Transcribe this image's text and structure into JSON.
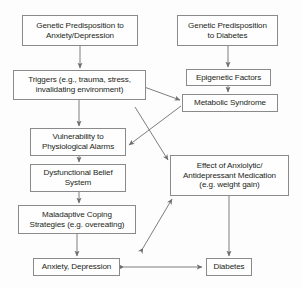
{
  "diagram": {
    "type": "flowchart",
    "colors": {
      "box_border": "#8a8a8a",
      "box_fill": "#fefefe",
      "text": "#231f20",
      "arrow": "#6f6f6f",
      "background": "#fdfdfd"
    },
    "nodes": [
      {
        "id": "genetic_anxiety",
        "label": "Genetic Predisposition to\nAnxiety/Depression"
      },
      {
        "id": "genetic_diabetes",
        "label": "Genetic Predisposition\nto Diabetes"
      },
      {
        "id": "triggers",
        "label": "Triggers (e.g., trauma, stress,\ninvalidating environment)"
      },
      {
        "id": "epigenetic",
        "label": "Epigenetic Factors"
      },
      {
        "id": "metabolic",
        "label": "Metabolic Syndrome"
      },
      {
        "id": "vulnerability",
        "label": "Vulnerability to\nPhysiological Alarms"
      },
      {
        "id": "dysfunctional",
        "label": "Dysfunctional Belief\nSystem"
      },
      {
        "id": "medication",
        "label": "Effect of Anxiolytic/\nAntidepressant Medication\n(e.g. weight gain)"
      },
      {
        "id": "maladaptive",
        "label": "Maladaptive Coping\nStrategies (e.g. overeating)"
      },
      {
        "id": "anxiety_depression",
        "label": "Anxiety, Depression"
      },
      {
        "id": "diabetes",
        "label": "Diabetes"
      }
    ],
    "edges": [
      {
        "from": "genetic_anxiety",
        "to": "triggers",
        "direction": "one-way"
      },
      {
        "from": "genetic_diabetes",
        "to": "epigenetic",
        "direction": "one-way"
      },
      {
        "from": "epigenetic",
        "to": "metabolic",
        "direction": "one-way"
      },
      {
        "from": "triggers",
        "to": "vulnerability",
        "direction": "one-way"
      },
      {
        "from": "triggers",
        "to": "metabolic",
        "direction": "two-way"
      },
      {
        "from": "metabolic",
        "to": "vulnerability",
        "direction": "one-way"
      },
      {
        "from": "metabolic",
        "to": "medication",
        "direction": "one-way"
      },
      {
        "from": "vulnerability",
        "to": "dysfunctional",
        "direction": "one-way"
      },
      {
        "from": "dysfunctional",
        "to": "maladaptive",
        "direction": "one-way"
      },
      {
        "from": "maladaptive",
        "to": "medication",
        "direction": "two-way"
      },
      {
        "from": "maladaptive",
        "to": "anxiety_depression",
        "direction": "one-way"
      },
      {
        "from": "medication",
        "to": "diabetes",
        "direction": "one-way"
      },
      {
        "from": "anxiety_depression",
        "to": "diabetes",
        "direction": "two-way"
      }
    ]
  }
}
